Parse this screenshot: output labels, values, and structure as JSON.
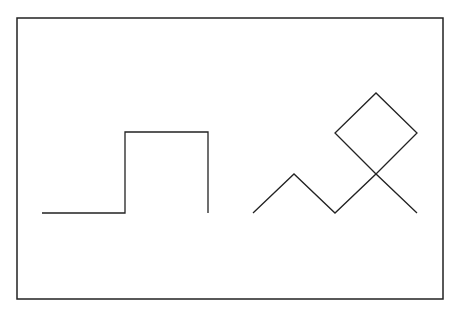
{
  "canvas": {
    "width": 464,
    "height": 313,
    "background": "#ffffff"
  },
  "stroke": {
    "color": "#222222",
    "width": 1.3
  },
  "frame": {
    "x": 17,
    "y": 18,
    "width": 426,
    "height": 281
  },
  "shapes": {
    "step_pulse": {
      "points": "42,213 125,213 125,132 208,132 208,213"
    },
    "zigzag": {
      "points": "253,213 294,174 335,213 376,174 417,213"
    },
    "diamond": {
      "points": "376,174 335,133 376,93 417,133 376,174"
    }
  }
}
